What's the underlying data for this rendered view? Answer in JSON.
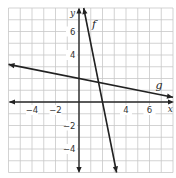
{
  "chart_data": {
    "type": "line",
    "title": "",
    "xlabel": "x",
    "ylabel": "y",
    "xlim": [
      -6,
      8
    ],
    "ylim": [
      -6,
      8
    ],
    "grid": true,
    "grid_step": 1,
    "x_tick_labels": [
      {
        "value": -4,
        "label": "−4"
      },
      {
        "value": -2,
        "label": "−2"
      },
      {
        "value": 4,
        "label": "4"
      },
      {
        "value": 6,
        "label": "6"
      }
    ],
    "y_tick_labels": [
      {
        "value": 6,
        "label": "6"
      },
      {
        "value": 4,
        "label": "4"
      },
      {
        "value": -2,
        "label": "−2"
      },
      {
        "value": -4,
        "label": "−4"
      }
    ],
    "series": [
      {
        "name": "f",
        "equation": "y = -5x + 10",
        "slope": -5,
        "intercept": 10,
        "x": [
          0.4,
          3.2
        ],
        "y": [
          8,
          -6
        ],
        "label_pos": [
          1.1,
          6.3
        ]
      },
      {
        "name": "g",
        "equation": "y = -0.2x + 2",
        "slope": -0.2,
        "intercept": 2,
        "x": [
          -6,
          8
        ],
        "y": [
          3.2,
          0.4
        ],
        "label_pos": [
          6.5,
          1.1
        ]
      }
    ],
    "intersection": {
      "x": 1.67,
      "y": 1.67
    },
    "colors": {
      "grid": "#c8c8c8",
      "axis": "#2a2a2a",
      "line": "#222222"
    }
  },
  "labels": {
    "x_axis": "x",
    "y_axis": "y",
    "f": "f",
    "g": "g"
  }
}
